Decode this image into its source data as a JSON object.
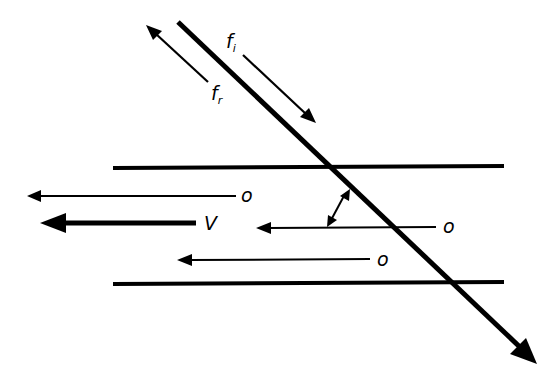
{
  "diagram": {
    "type": "doppler-flow-geometry",
    "colors": {
      "stroke": "#000000",
      "background": "#ffffff"
    },
    "labels": {
      "incident_f": "f",
      "incident_sub": "i",
      "reflected_f": "f",
      "reflected_sub": "r",
      "velocity": "V",
      "origin_top": "o",
      "origin_middle": "o",
      "origin_bottom": "o"
    },
    "elements": {
      "vessel_walls": [
        "upper wall",
        "lower wall"
      ],
      "beam": "ultrasound beam (diagonal arrow)",
      "angle_marker": "double-headed arc arrow between beam and flow",
      "flow_arrows": 3,
      "velocity_arrow": 1
    }
  }
}
